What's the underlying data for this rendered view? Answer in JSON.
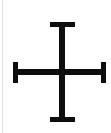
{
  "canvas": {
    "width": 111,
    "height": 133,
    "background_color": "#ffffff"
  },
  "edge_rule": {
    "name": "left-edge-rule",
    "color": "#e3e3e3",
    "x": 2,
    "width": 1,
    "height": 133
  },
  "glyph": {
    "name": "cross-symbol",
    "description": "Serif cross / dagger symbol",
    "character": "✝",
    "fill_color": "#0d0d0d",
    "stroke_width": 6,
    "center": {
      "x": 62,
      "y": 72
    },
    "parts": {
      "vertical_stem": {
        "x": 59,
        "y": 22,
        "width": 6,
        "height": 100
      },
      "horizontal_bar": {
        "x": 13,
        "y": 69,
        "width": 93,
        "height": 6
      },
      "top_serif": {
        "x": 50,
        "y": 22,
        "width": 25,
        "height": 5
      },
      "bottom_serif": {
        "x": 50,
        "y": 117,
        "width": 25,
        "height": 5
      },
      "left_serif": {
        "x": 13,
        "y": 62,
        "width": 5,
        "height": 21
      },
      "right_serif": {
        "x": 101,
        "y": 62,
        "width": 5,
        "height": 21
      }
    }
  }
}
